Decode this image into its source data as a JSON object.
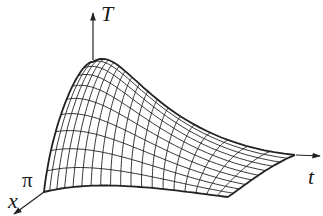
{
  "figure": {
    "axes": {
      "vertical_label": "T",
      "time_label": "t",
      "space_label": "x",
      "space_tick_label": "π"
    },
    "grid": {
      "x_lines": 10,
      "t_lines": 19
    },
    "colors": {
      "line": "#222222",
      "background": "#ffffff"
    }
  }
}
